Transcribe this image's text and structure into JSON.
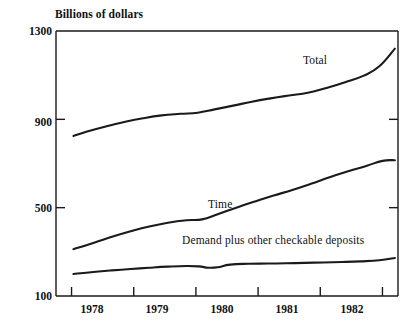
{
  "chart_data": {
    "type": "line",
    "title": "",
    "ylabel": "Billions of dollars",
    "xlabel": "",
    "ylim": [
      100,
      1300
    ],
    "yticks": [
      100,
      500,
      900,
      1300
    ],
    "ytick_labels": [
      "100",
      "500",
      "900",
      "1300"
    ],
    "xlim": [
      1977.5,
      1983.0
    ],
    "xticks": [
      1977.75,
      1978.75,
      1979.75,
      1980.75,
      1981.75,
      1982.75
    ],
    "xtick_labels": [
      "1978",
      "1979",
      "1980",
      "1981",
      "1982"
    ],
    "grid": false,
    "legend": "inline-annotations",
    "series": [
      {
        "name": "Total",
        "label": "Total",
        "x": [
          1977.78,
          1978.0,
          1978.3,
          1978.6,
          1978.9,
          1979.2,
          1979.5,
          1979.78,
          1980.05,
          1980.35,
          1980.65,
          1980.95,
          1981.25,
          1981.55,
          1981.85,
          1982.15,
          1982.45,
          1982.7,
          1982.95
        ],
        "values": [
          825,
          845,
          868,
          888,
          905,
          918,
          925,
          930,
          945,
          962,
          980,
          995,
          1008,
          1020,
          1042,
          1068,
          1098,
          1140,
          1220
        ]
      },
      {
        "name": "Time",
        "label": "Time",
        "x": [
          1977.78,
          1978.1,
          1978.4,
          1978.7,
          1979.0,
          1979.3,
          1979.6,
          1979.85,
          1980.1,
          1980.4,
          1980.7,
          1981.0,
          1981.3,
          1981.6,
          1981.9,
          1982.2,
          1982.5,
          1982.75,
          1982.95
        ],
        "values": [
          312,
          340,
          368,
          393,
          415,
          432,
          443,
          447,
          470,
          500,
          528,
          555,
          580,
          608,
          638,
          665,
          690,
          712,
          715
        ]
      },
      {
        "name": "Demand plus other checkable deposits",
        "label": "Demand plus other checkable deposits",
        "x": [
          1977.78,
          1978.1,
          1978.4,
          1978.7,
          1979.0,
          1979.3,
          1979.6,
          1979.8,
          1979.95,
          1980.1,
          1980.3,
          1980.6,
          1980.9,
          1981.2,
          1981.5,
          1981.8,
          1982.1,
          1982.4,
          1982.7,
          1982.95
        ],
        "values": [
          200,
          209,
          216,
          222,
          228,
          233,
          236,
          234,
          228,
          230,
          242,
          246,
          247,
          248,
          250,
          252,
          254,
          257,
          262,
          272
        ]
      }
    ],
    "annotations": [
      {
        "text": "Total",
        "x": 1982.0,
        "y": 1160
      },
      {
        "text": "Time",
        "x": 1979.9,
        "y": 540
      },
      {
        "text": "Demand plus other checkable deposits",
        "x": 1981.4,
        "y": 405
      }
    ]
  },
  "axis": {
    "y_title": "Billions of dollars",
    "y_labels": [
      "1300",
      "900",
      "500",
      "100"
    ],
    "x_labels": [
      "1978",
      "1979",
      "1980",
      "1981",
      "1982"
    ]
  },
  "series_labels": {
    "total": "Total",
    "time": "Time",
    "demand": "Demand plus other checkable deposits"
  },
  "colors": {
    "line": "#1a1a1a",
    "axis": "#1a1a1a",
    "background": "#ffffff"
  }
}
